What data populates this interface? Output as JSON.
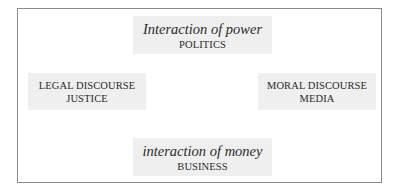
{
  "diagram": {
    "top": {
      "title": "Interaction of power",
      "label": "POLITICS"
    },
    "left": {
      "line1": "LEGAL DISCOURSE",
      "line2": "JUSTICE"
    },
    "right": {
      "line1": "MORAL DISCOURSE",
      "line2": "MEDIA"
    },
    "bottom": {
      "title": "interaction of money",
      "label": "BUSINESS"
    }
  },
  "colors": {
    "box_fill": "#efefef",
    "frame_border": "#8a8a8a",
    "text": "#2a2a2a"
  }
}
